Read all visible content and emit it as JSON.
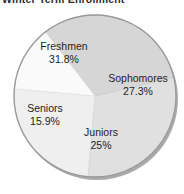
{
  "chart_data": {
    "type": "pie",
    "title": "Winter Term Enrollment",
    "xlabel": "",
    "ylabel": "",
    "legend_position": "none",
    "grid": false,
    "categories": [
      "Freshmen",
      "Sophomores",
      "Juniors",
      "Seniors"
    ],
    "values": [
      31.8,
      27.3,
      25,
      15.9
    ],
    "labels": [
      "31.8%",
      "27.3%",
      "25%",
      "15.9%"
    ],
    "units": "percent",
    "slices": [
      {
        "name": "Freshmen",
        "value": 31.8,
        "label": "31.8%",
        "color": "#d6d6d6",
        "start_angle_deg": 232.3,
        "end_angle_deg": 346.8
      },
      {
        "name": "Sophomores",
        "value": 27.3,
        "label": "27.3%",
        "color": "#e0e0e0",
        "start_angle_deg": 346.8,
        "end_angle_deg": 95.1
      },
      {
        "name": "Juniors",
        "value": 25,
        "label": "25%",
        "color": "#efefef",
        "start_angle_deg": 95.1,
        "end_angle_deg": 185.1
      },
      {
        "name": "Seniors",
        "value": 15.9,
        "label": "15.9%",
        "color": "#fafafa",
        "start_angle_deg": 185.1,
        "end_angle_deg": 232.3
      }
    ],
    "colors": {
      "freshmen": "#d6d6d6",
      "sophomores": "#e0e0e0",
      "juniors": "#efefef",
      "seniors": "#fafafa",
      "outline": "#9a9a9a",
      "shadow": "#8e8e8e",
      "text": "#1e1e1e",
      "background": "#ffffff"
    }
  }
}
